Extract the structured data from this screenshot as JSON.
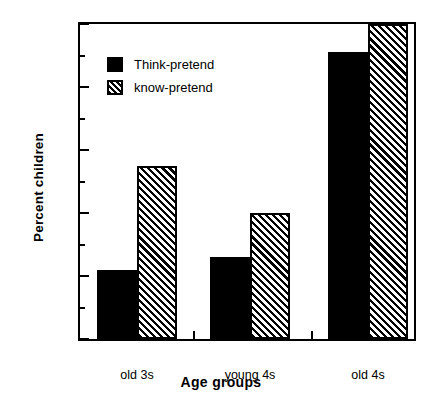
{
  "chart_data": {
    "type": "bar",
    "title": "",
    "xlabel": "Age  groups",
    "ylabel": "Percent children",
    "categories": [
      "old 3s",
      "young 4s",
      "old 4s"
    ],
    "series": [
      {
        "name": "Think-pretend",
        "values": [
          22,
          26,
          91
        ],
        "fill": "solid",
        "color": "#000000"
      },
      {
        "name": "know-pretend",
        "values": [
          55,
          40,
          100
        ],
        "fill": "hatch",
        "color": "#000000"
      }
    ],
    "ylim": [
      0,
      100
    ],
    "yticks": [
      0,
      20,
      40,
      60,
      80,
      100
    ],
    "ytick_labels": [
      "0",
      "20",
      "40",
      "60",
      "80",
      "100"
    ],
    "yminor_ticks": [
      10,
      30,
      50,
      70,
      90
    ],
    "grid": false,
    "legend_position": "upper-left-inside",
    "frame": "box"
  },
  "axis": {
    "ylabel": "Percent children",
    "xlabel": "Age  groups"
  },
  "legend": {
    "items": [
      {
        "label": "Think-pretend"
      },
      {
        "label": "know-pretend"
      }
    ]
  }
}
